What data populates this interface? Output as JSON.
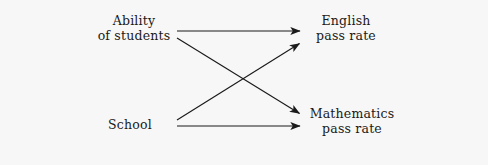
{
  "diagram": {
    "background_color": "#f7f7f7",
    "line_color": "#1a1a1a",
    "nodes": [
      {
        "id": "ability",
        "name": "ability-of-students",
        "lines": [
          "Ability",
          "of students"
        ],
        "line1": "Ability",
        "line2": "of students",
        "side": "left",
        "position": "top"
      },
      {
        "id": "school",
        "name": "school",
        "lines": [
          "School"
        ],
        "line1": "School",
        "line2": "",
        "side": "left",
        "position": "bottom"
      },
      {
        "id": "english",
        "name": "english-pass-rate",
        "lines": [
          "English",
          "pass rate"
        ],
        "line1": "English",
        "line2": "pass rate",
        "side": "right",
        "position": "top"
      },
      {
        "id": "mathematics",
        "name": "mathematics-pass-rate",
        "lines": [
          "Mathematics",
          "pass rate"
        ],
        "line1": "Mathematics",
        "line2": "pass rate",
        "side": "right",
        "position": "bottom"
      }
    ],
    "edges": [
      {
        "id": "ability-to-english",
        "from": "ability",
        "to": "english",
        "style": "solid-arrow",
        "x1": 177,
        "y1": 31,
        "x2": 302,
        "y2": 31
      },
      {
        "id": "ability-to-mathematics",
        "from": "ability",
        "to": "mathematics",
        "style": "solid-arrow",
        "x1": 177,
        "y1": 38,
        "x2": 302,
        "y2": 114
      },
      {
        "id": "school-to-english",
        "from": "school",
        "to": "english",
        "style": "solid-arrow",
        "x1": 177,
        "y1": 120,
        "x2": 302,
        "y2": 43
      },
      {
        "id": "school-to-mathematics",
        "from": "school",
        "to": "mathematics",
        "style": "solid-arrow",
        "x1": 177,
        "y1": 126,
        "x2": 302,
        "y2": 126
      }
    ]
  }
}
